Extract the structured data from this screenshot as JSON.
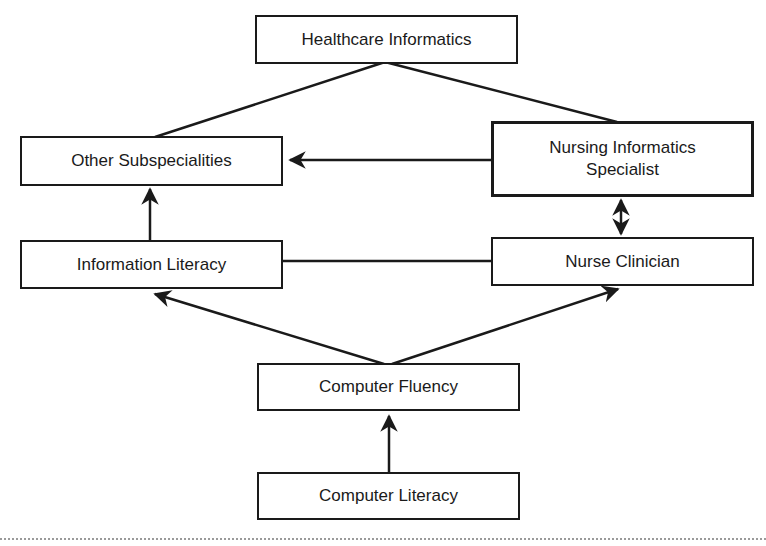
{
  "diagram": {
    "nodes": {
      "healthcare_informatics": "Healthcare Informatics",
      "other_subspecialities": "Other Subspecialities",
      "nursing_informatics_specialist_line1": "Nursing Informatics",
      "nursing_informatics_specialist_line2": "Specialist",
      "information_literacy": "Information Literacy",
      "nurse_clinician": "Nurse Clinician",
      "computer_fluency": "Computer Fluency",
      "computer_literacy": "Computer Literacy"
    },
    "edges": [
      {
        "from": "Healthcare Informatics",
        "to": "Other Subspecialities",
        "type": "line"
      },
      {
        "from": "Healthcare Informatics",
        "to": "Nursing Informatics Specialist",
        "type": "line"
      },
      {
        "from": "Nursing Informatics Specialist",
        "to": "Other Subspecialities",
        "type": "arrow"
      },
      {
        "from": "Information Literacy",
        "to": "Other Subspecialities",
        "type": "arrow"
      },
      {
        "from": "Nursing Informatics Specialist",
        "to": "Nurse Clinician",
        "type": "bidirectional-arrow"
      },
      {
        "from": "Information Literacy",
        "to": "Nurse Clinician",
        "type": "line"
      },
      {
        "from": "Computer Fluency",
        "to": "Information Literacy",
        "type": "arrow"
      },
      {
        "from": "Computer Fluency",
        "to": "Nurse Clinician",
        "type": "arrow"
      },
      {
        "from": "Computer Literacy",
        "to": "Computer Fluency",
        "type": "arrow"
      }
    ]
  }
}
